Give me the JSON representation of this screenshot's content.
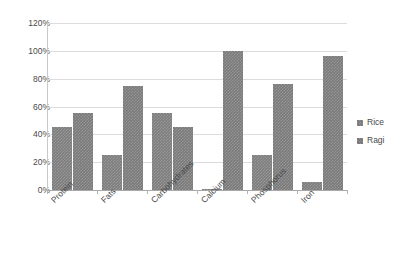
{
  "chart_data": {
    "type": "bar",
    "title": "",
    "subtitle": "",
    "xlabel": "",
    "ylabel": "",
    "categories": [
      "Protein",
      "Fats",
      "Carbohydrates",
      "Calcium",
      "Phosphorus",
      "Iron"
    ],
    "series": [
      {
        "name": "Rice",
        "values": [
          45,
          25,
          55,
          1,
          25,
          6
        ],
        "color": "#7d7d7d"
      },
      {
        "name": "Ragi",
        "values": [
          55,
          75,
          45,
          100,
          76,
          96
        ],
        "color": "#7a7a7a"
      }
    ],
    "ylim": [
      0,
      120
    ],
    "yticks": [
      0,
      20,
      40,
      60,
      80,
      100,
      120
    ],
    "ytick_labels": [
      "0%",
      "20%",
      "40%",
      "60%",
      "80%",
      "100%",
      "120%"
    ],
    "grid": true,
    "grid_axis": "y",
    "legend_position": "right",
    "value_suffix": "%",
    "xtick_label_rotation": -45
  }
}
